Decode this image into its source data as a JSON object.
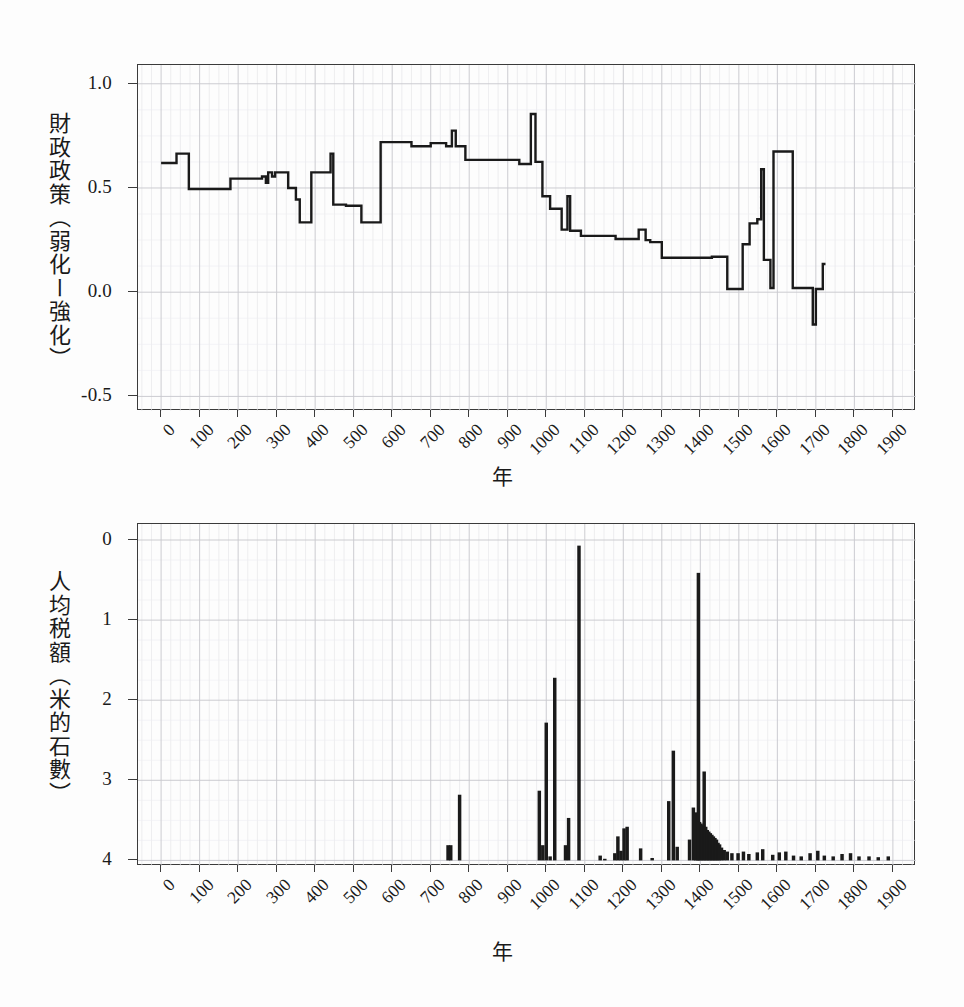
{
  "figure": {
    "background": "#ffffff",
    "ink_color": "#1a1a1a",
    "grid_color": "#c9c9cf",
    "frame_color": "#3b3b3b"
  },
  "panels": [
    {
      "id": "fiscal-policy",
      "ylabel": "財政政策（弱化ー強化）",
      "xlabel": "年",
      "ytick_labels": [
        "1.0",
        "0.5",
        "0.0",
        "-0.5"
      ],
      "xtick_labels": [
        "0",
        "100",
        "200",
        "300",
        "400",
        "500",
        "600",
        "700",
        "800",
        "900",
        "1000",
        "1100",
        "1200",
        "1300",
        "1400",
        "1500",
        "1600",
        "1700",
        "1800",
        "1900"
      ]
    },
    {
      "id": "tax-per-capita",
      "ylabel": "人均税額（米的石數）",
      "xlabel": "年",
      "ytick_labels": [
        "4",
        "3",
        "2",
        "1",
        "0"
      ],
      "xtick_labels": [
        "0",
        "100",
        "200",
        "300",
        "400",
        "500",
        "600",
        "700",
        "800",
        "900",
        "1000",
        "1100",
        "1200",
        "1300",
        "1400",
        "1500",
        "1600",
        "1700",
        "1800",
        "1900"
      ]
    }
  ],
  "chart_data": [
    {
      "type": "line",
      "id": "fiscal-policy",
      "title": "",
      "xlabel": "年",
      "ylabel": "財政政策（弱化ー強化）",
      "xlim": [
        -60,
        1960
      ],
      "ylim": [
        -0.57,
        1.09
      ],
      "yticks": [
        1.0,
        0.5,
        0.0,
        -0.5
      ],
      "xticks": [
        0,
        100,
        200,
        300,
        400,
        500,
        600,
        700,
        800,
        900,
        1000,
        1100,
        1200,
        1300,
        1400,
        1500,
        1600,
        1700,
        1800,
        1900
      ],
      "grid": true,
      "minor_grid_x_step": 25,
      "minor_grid_y_step": 0.125,
      "legend": null,
      "drawstyle": "steps-post",
      "note": "step function of fiscal policy index over time, x in years",
      "points": [
        [
          0,
          0.62
        ],
        [
          40,
          0.62
        ],
        [
          40,
          0.665
        ],
        [
          72,
          0.665
        ],
        [
          72,
          0.495
        ],
        [
          180,
          0.495
        ],
        [
          180,
          0.545
        ],
        [
          262,
          0.545
        ],
        [
          262,
          0.555
        ],
        [
          272,
          0.555
        ],
        [
          272,
          0.525
        ],
        [
          278,
          0.525
        ],
        [
          278,
          0.575
        ],
        [
          288,
          0.575
        ],
        [
          288,
          0.555
        ],
        [
          296,
          0.555
        ],
        [
          296,
          0.575
        ],
        [
          330,
          0.575
        ],
        [
          330,
          0.5
        ],
        [
          350,
          0.5
        ],
        [
          350,
          0.445
        ],
        [
          360,
          0.445
        ],
        [
          360,
          0.335
        ],
        [
          390,
          0.335
        ],
        [
          390,
          0.575
        ],
        [
          440,
          0.575
        ],
        [
          440,
          0.665
        ],
        [
          447,
          0.665
        ],
        [
          447,
          0.42
        ],
        [
          480,
          0.42
        ],
        [
          480,
          0.415
        ],
        [
          520,
          0.415
        ],
        [
          520,
          0.335
        ],
        [
          570,
          0.335
        ],
        [
          570,
          0.72
        ],
        [
          650,
          0.72
        ],
        [
          650,
          0.7
        ],
        [
          700,
          0.7
        ],
        [
          700,
          0.715
        ],
        [
          740,
          0.715
        ],
        [
          740,
          0.7
        ],
        [
          755,
          0.7
        ],
        [
          755,
          0.775
        ],
        [
          765,
          0.775
        ],
        [
          765,
          0.7
        ],
        [
          790,
          0.7
        ],
        [
          790,
          0.635
        ],
        [
          930,
          0.635
        ],
        [
          930,
          0.615
        ],
        [
          960,
          0.615
        ],
        [
          960,
          0.855
        ],
        [
          972,
          0.855
        ],
        [
          972,
          0.625
        ],
        [
          990,
          0.625
        ],
        [
          990,
          0.46
        ],
        [
          1010,
          0.46
        ],
        [
          1010,
          0.4
        ],
        [
          1040,
          0.4
        ],
        [
          1040,
          0.3
        ],
        [
          1055,
          0.3
        ],
        [
          1055,
          0.46
        ],
        [
          1062,
          0.46
        ],
        [
          1062,
          0.295
        ],
        [
          1090,
          0.295
        ],
        [
          1090,
          0.27
        ],
        [
          1180,
          0.27
        ],
        [
          1180,
          0.255
        ],
        [
          1240,
          0.255
        ],
        [
          1240,
          0.3
        ],
        [
          1258,
          0.3
        ],
        [
          1258,
          0.25
        ],
        [
          1270,
          0.25
        ],
        [
          1270,
          0.24
        ],
        [
          1300,
          0.24
        ],
        [
          1300,
          0.165
        ],
        [
          1430,
          0.165
        ],
        [
          1430,
          0.17
        ],
        [
          1470,
          0.17
        ],
        [
          1470,
          0.015
        ],
        [
          1510,
          0.015
        ],
        [
          1510,
          0.23
        ],
        [
          1528,
          0.23
        ],
        [
          1528,
          0.33
        ],
        [
          1548,
          0.33
        ],
        [
          1548,
          0.35
        ],
        [
          1558,
          0.35
        ],
        [
          1558,
          0.59
        ],
        [
          1565,
          0.59
        ],
        [
          1565,
          0.155
        ],
        [
          1582,
          0.155
        ],
        [
          1582,
          0.02
        ],
        [
          1590,
          0.02
        ],
        [
          1590,
          0.675
        ],
        [
          1640,
          0.675
        ],
        [
          1640,
          0.02
        ],
        [
          1692,
          0.02
        ],
        [
          1692,
          -0.155
        ],
        [
          1700,
          -0.155
        ],
        [
          1700,
          0.015
        ],
        [
          1718,
          0.015
        ],
        [
          1718,
          0.135
        ],
        [
          1725,
          0.135
        ]
      ]
    },
    {
      "type": "bar",
      "id": "tax-per-capita",
      "title": "",
      "xlabel": "年",
      "ylabel": "人均税額（米的石數）",
      "xlim": [
        -60,
        1960
      ],
      "ylim": [
        -0.07,
        4.2
      ],
      "yticks": [
        0,
        1,
        2,
        3,
        4
      ],
      "xticks": [
        0,
        100,
        200,
        300,
        400,
        500,
        600,
        700,
        800,
        900,
        1000,
        1100,
        1200,
        1300,
        1400,
        1500,
        1600,
        1700,
        1800,
        1900
      ],
      "grid": true,
      "minor_grid_x_step": 25,
      "minor_grid_y_step": 0.25,
      "legend": null,
      "bar_width_years": 9,
      "note": "per-capita tax burden in koku of rice; x in years. Sparse before 750, peaks 3.93 near 1085 and 3.59 near 1395.",
      "x": [
        745,
        752,
        775,
        982,
        991,
        1000,
        1010,
        1022,
        1050,
        1058,
        1085,
        1140,
        1152,
        1178,
        1186,
        1194,
        1202,
        1210,
        1245,
        1275,
        1318,
        1330,
        1340,
        1372,
        1382,
        1388,
        1392,
        1395,
        1398,
        1402,
        1406,
        1410,
        1414,
        1418,
        1422,
        1426,
        1430,
        1434,
        1438,
        1442,
        1446,
        1450,
        1455,
        1462,
        1470,
        1482,
        1498,
        1512,
        1526,
        1548,
        1562,
        1588,
        1605,
        1622,
        1642,
        1662,
        1685,
        1705,
        1722,
        1745,
        1768,
        1790,
        1812,
        1838,
        1862,
        1888
      ],
      "values": [
        0.19,
        0.19,
        0.82,
        0.87,
        0.19,
        1.72,
        0.05,
        2.28,
        0.19,
        0.53,
        3.93,
        0.06,
        0.02,
        0.09,
        0.3,
        0.12,
        0.4,
        0.42,
        0.15,
        0.03,
        0.74,
        1.37,
        0.17,
        0.26,
        0.66,
        0.6,
        0.58,
        3.59,
        0.48,
        0.46,
        0.44,
        1.11,
        0.42,
        0.38,
        0.36,
        0.34,
        0.32,
        0.3,
        0.28,
        0.26,
        0.22,
        0.2,
        0.16,
        0.13,
        0.11,
        0.09,
        0.09,
        0.11,
        0.08,
        0.1,
        0.14,
        0.07,
        0.1,
        0.11,
        0.06,
        0.05,
        0.09,
        0.12,
        0.06,
        0.05,
        0.08,
        0.09,
        0.05,
        0.05,
        0.04,
        0.05
      ]
    }
  ]
}
